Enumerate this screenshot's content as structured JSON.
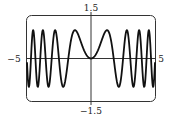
{
  "chart_data": {
    "type": "line",
    "title": "",
    "function": "sin(x^2)",
    "xlabel": "",
    "ylabel": "",
    "xlim": [
      -5,
      5
    ],
    "ylim": [
      -1.5,
      1.5
    ],
    "tick_labels": {
      "x_min": "−5",
      "x_max": "5",
      "y_max": "1.5",
      "y_min": "−1.5"
    },
    "grid": false,
    "legend": null,
    "series": [
      {
        "name": "y = sin(x²)",
        "color": "#111111",
        "samples": 600
      }
    ]
  }
}
